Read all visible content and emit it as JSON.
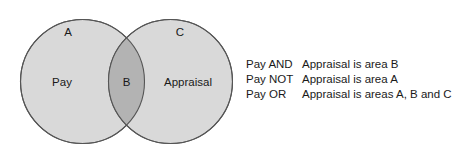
{
  "diagram": {
    "type": "venn-2-set",
    "left_set": {
      "name": "Pay",
      "exclusive_region_label": "A",
      "fill_color": "#d9d9d9",
      "stroke_color": "#555555"
    },
    "right_set": {
      "name": "Appraisal",
      "exclusive_region_label": "C",
      "fill_color": "#d9d9d9",
      "stroke_color": "#555555"
    },
    "intersection": {
      "label": "B",
      "fill_color": "#b3b3b3"
    }
  },
  "legend": {
    "rows": [
      {
        "expression": "Pay AND",
        "result": "Appraisal is area B"
      },
      {
        "expression": "Pay NOT",
        "result": "Appraisal is area A"
      },
      {
        "expression": "Pay OR",
        "result": "Appraisal is areas A, B and C"
      }
    ]
  }
}
